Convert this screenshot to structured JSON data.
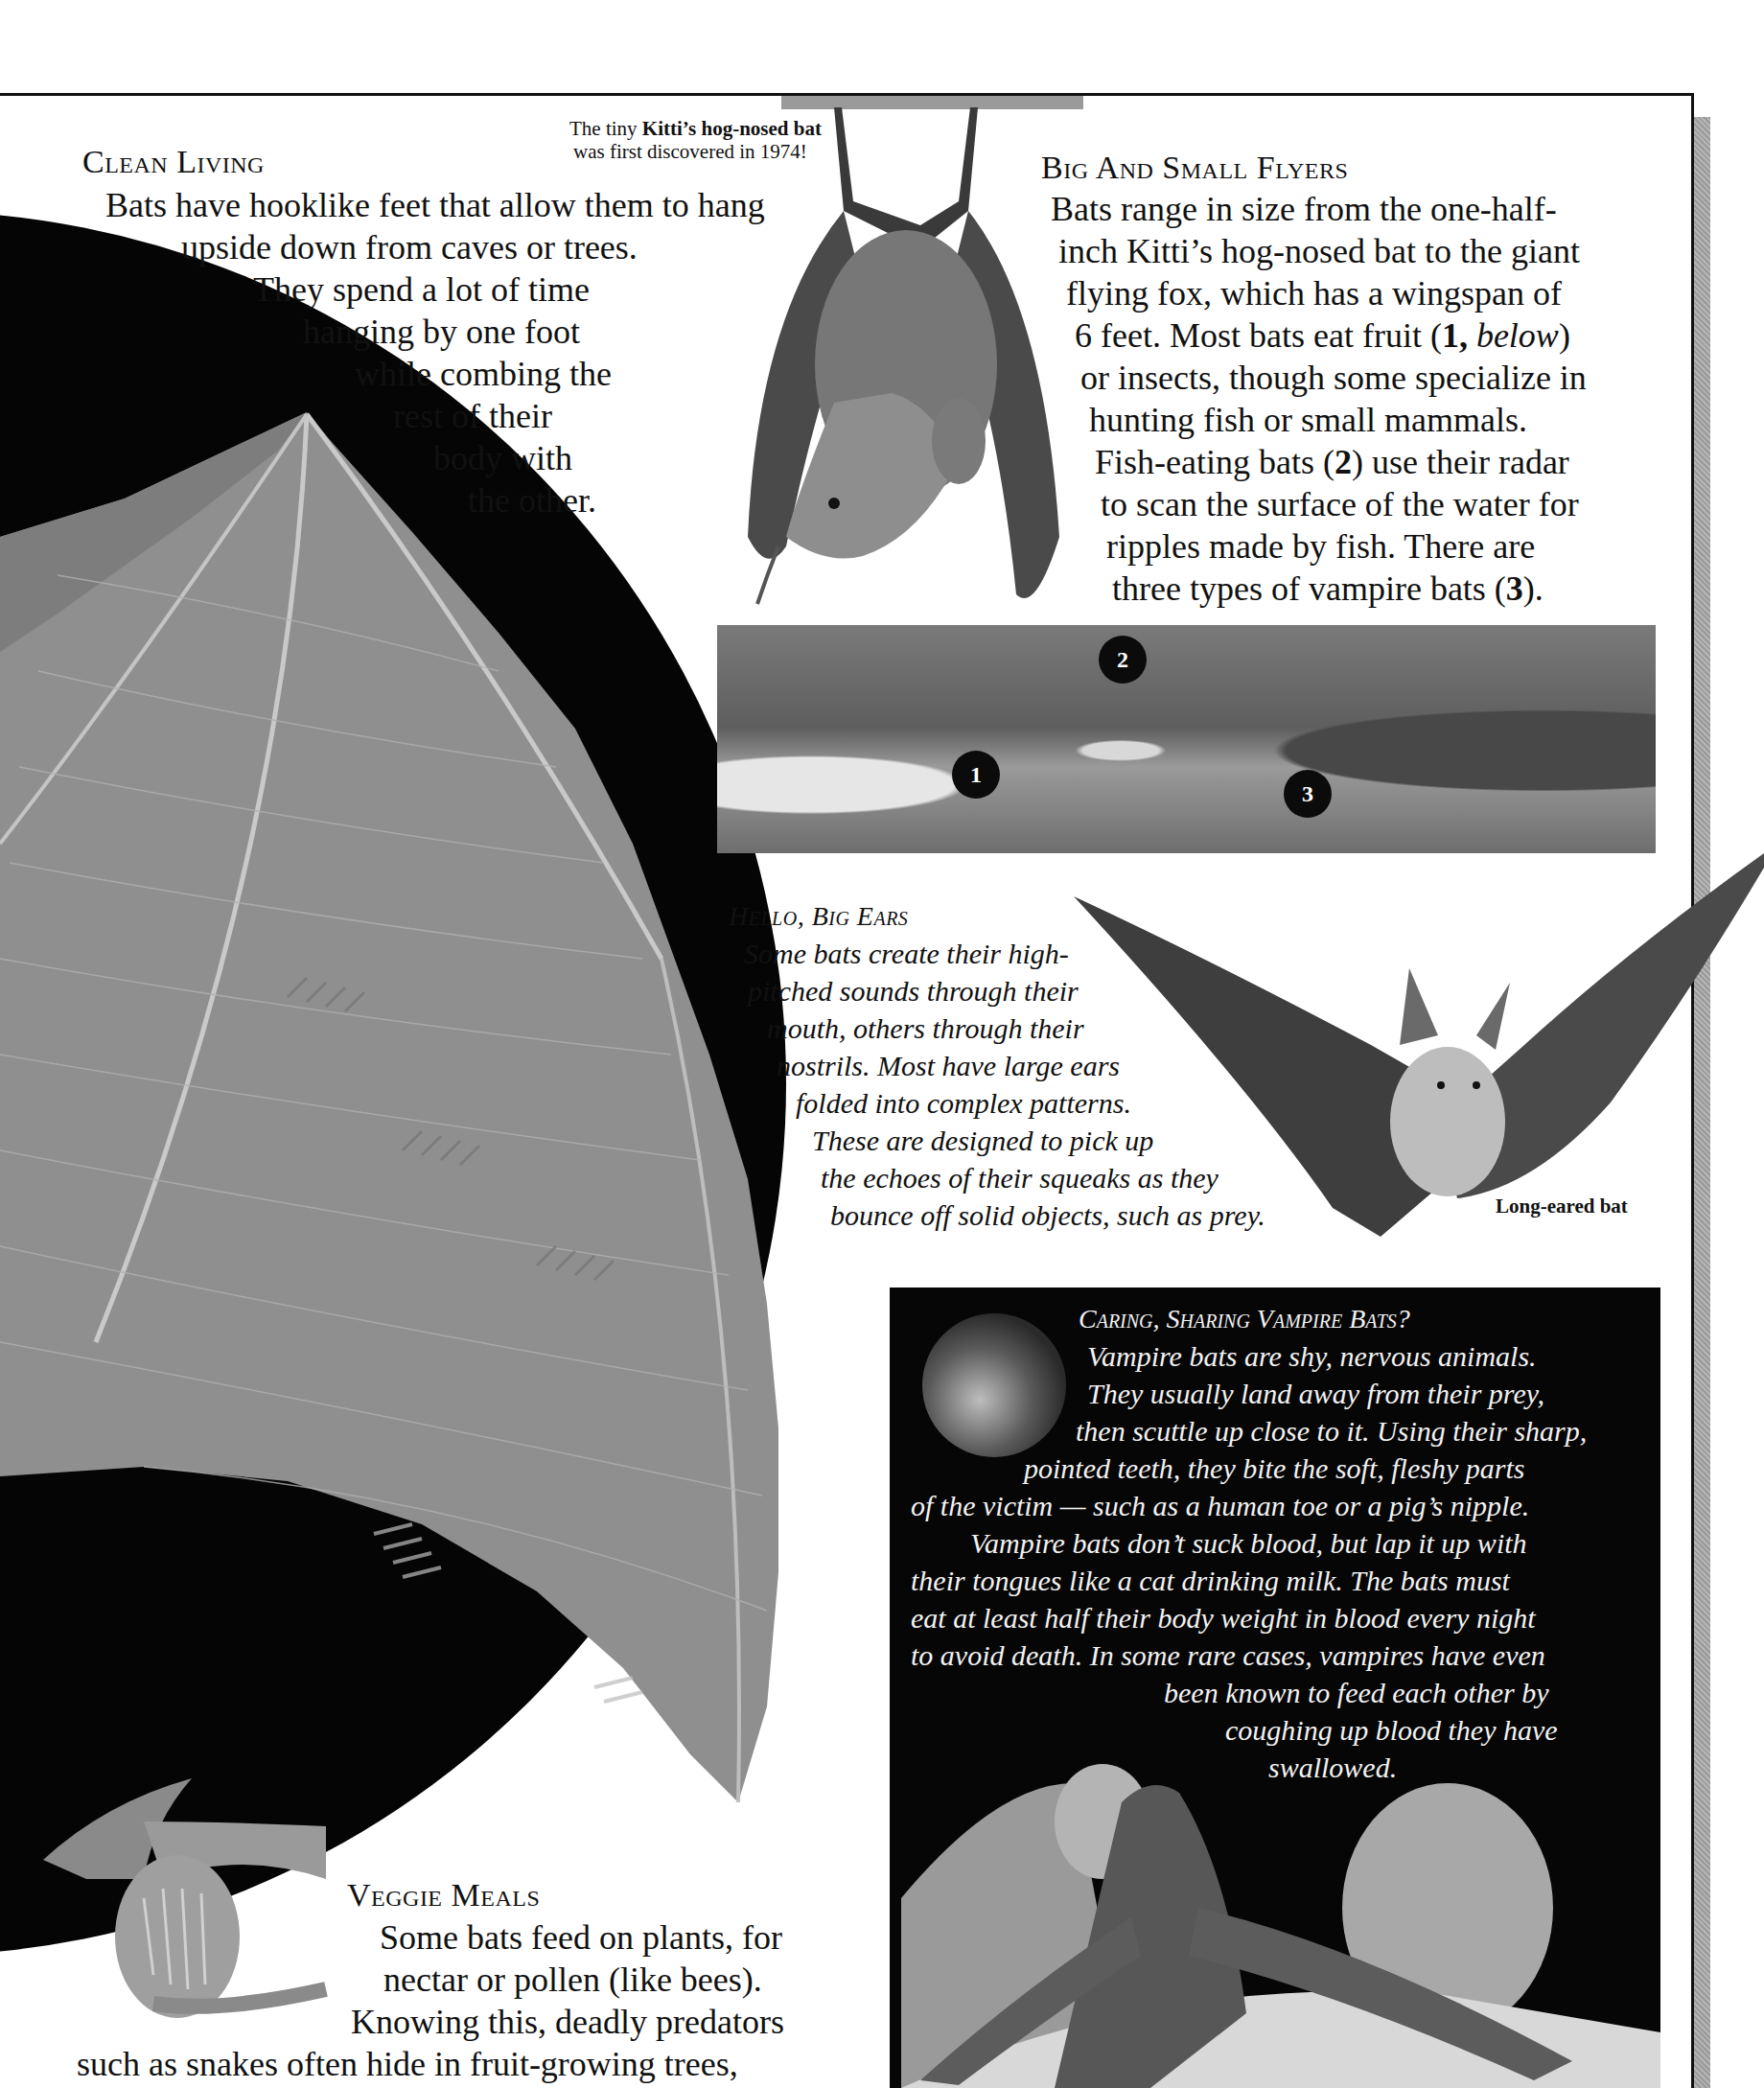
{
  "page": {
    "background": "#ffffff",
    "frame_color": "#111111",
    "shadow_color": "#a6a6a6"
  },
  "caption_kitti": {
    "line1_prefix": "The tiny ",
    "line1_bold": "Kitti’s hog-nosed bat",
    "line2": "was first discovered in 1974!"
  },
  "clean_living": {
    "title": "Clean Living",
    "lines": [
      "Bats have hooklike feet that allow them to hang",
      "upside down from caves or trees.",
      "They spend a lot of time",
      "hanging by one foot",
      "while combing the",
      "rest of their",
      "body with",
      "the other."
    ]
  },
  "big_small_flyers": {
    "title": "Big And Small Flyers",
    "lines": [
      "Bats range in size from the one-half-",
      "inch Kitti’s hog-nosed bat to the giant",
      "flying fox, which has a wingspan of",
      "6 feet. Most bats eat fruit (",
      "or insects, though some specialize in",
      "hunting fish or small mammals.",
      "Fish-eating bats (",
      "to scan the surface of the water for",
      "ripples made by fish. There are",
      "three types of vampire bats ("
    ],
    "ref1_num": "1,",
    "ref1_word": "below",
    "ref1_close": ")",
    "ref2_num": "2",
    "ref2_close": ") use their radar",
    "ref3_num": "3",
    "ref3_close": ")."
  },
  "panorama": {
    "badges": [
      "1",
      "2",
      "3"
    ]
  },
  "hello_big_ears": {
    "title": "Hello, Big Ears",
    "lines": [
      "Some bats create their high-",
      "pitched sounds through their",
      "mouth, others through their",
      "nostrils. Most have large ears",
      "folded into complex patterns.",
      "These are designed to pick up",
      "the echoes of their squeaks as they",
      "bounce off solid objects, such as prey."
    ]
  },
  "long_eared_caption": "Long-eared bat",
  "vampire": {
    "title": "Caring, Sharing Vampire Bats?",
    "lines": [
      "Vampire bats are shy, nervous animals.",
      "They usually land away from their prey,",
      "then scuttle up close to it. Using their sharp,",
      "pointed teeth, they bite the soft, fleshy parts",
      "of the victim — such as a human toe or a pig’s nipple.",
      "Vampire bats don’t suck blood, but lap it up with",
      "their tongues like a cat drinking milk. The bats must",
      "eat at least half their body weight in blood every night",
      "to avoid death. In some rare cases, vampires have even",
      "been known to feed each other by",
      "coughing up blood they have",
      "swallowed."
    ]
  },
  "veggie_meals": {
    "title": "Veggie Meals",
    "lines": [
      "Some bats feed on plants, for",
      "nectar or pollen (like bees).",
      "Knowing this, deadly predators",
      "such as snakes often hide in fruit-growing trees,"
    ]
  }
}
